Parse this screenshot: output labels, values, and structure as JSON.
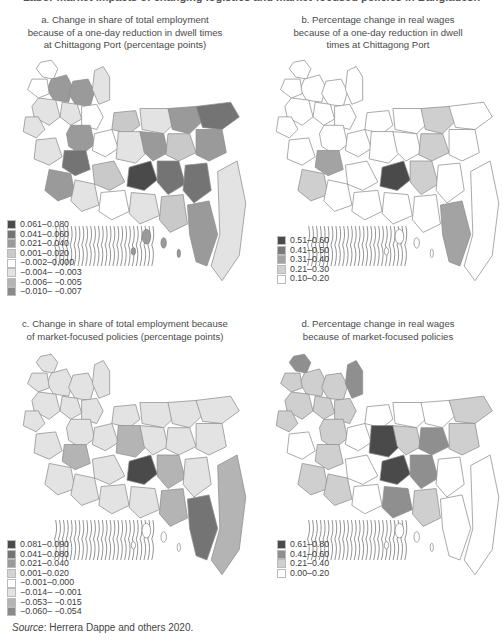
{
  "figure": {
    "title": "Labor market impacts of changing logistics and market-focused policies in Bangladesh"
  },
  "panels": [
    {
      "id": "a",
      "title_lines": [
        "a. Change in share of total employment",
        "because of a one-day reduction in dwell times",
        "at Chittagong Port (percentage points)"
      ],
      "legend": [
        {
          "label": "0.061–0.080",
          "color": "#4a4a4a"
        },
        {
          "label": "0.041–0.060",
          "color": "#747474"
        },
        {
          "label": "0.021–0.040",
          "color": "#9a9a9a"
        },
        {
          "label": "0.001–0.020",
          "color": "#c9c9c9"
        },
        {
          "label": "−0.002–0.000",
          "color": "#ffffff"
        },
        {
          "label": "−0.004– −0.003",
          "color": "#e3e3e3"
        },
        {
          "label": "−0.006– −0.005",
          "color": "#b4b4b4"
        },
        {
          "label": "−0.010– −0.007",
          "color": "#8a8a8a"
        }
      ]
    },
    {
      "id": "b",
      "title_lines": [
        "b. Percentage change in real wages",
        "because of a one-day reduction in dwell",
        "times at Chittagong Port"
      ],
      "legend": [
        {
          "label": "0.51–0.60",
          "color": "#4a4a4a"
        },
        {
          "label": "0.41–0.50",
          "color": "#7a7a7a"
        },
        {
          "label": "0.31–0.40",
          "color": "#a3a3a3"
        },
        {
          "label": "0.21–0.30",
          "color": "#cfcfcf"
        },
        {
          "label": "0.10–0.20",
          "color": "#ffffff"
        }
      ]
    },
    {
      "id": "c",
      "title_lines": [
        "c. Change in share of total employment because",
        "of market-focused policies (percentage points)"
      ],
      "legend": [
        {
          "label": "0.081–0.090",
          "color": "#4a4a4a"
        },
        {
          "label": "0.041–0.080",
          "color": "#747474"
        },
        {
          "label": "0.021–0.040",
          "color": "#9a9a9a"
        },
        {
          "label": "0.001–0.020",
          "color": "#d2d2d2"
        },
        {
          "label": "−0.001–0.000",
          "color": "#ffffff"
        },
        {
          "label": "−0.014– −0.001",
          "color": "#e3e3e3"
        },
        {
          "label": "−0.053– −0.015",
          "color": "#b4b4b4"
        },
        {
          "label": "−0.060– −0.054",
          "color": "#8a8a8a"
        }
      ]
    },
    {
      "id": "d",
      "title_lines": [
        "d. Percentage change in real wages",
        "because of market-focused policies"
      ],
      "legend": [
        {
          "label": "0.61–0.80",
          "color": "#4a4a4a"
        },
        {
          "label": "0.41–0.60",
          "color": "#8f8f8f"
        },
        {
          "label": "0.21–0.40",
          "color": "#cfcfcf"
        },
        {
          "label": "0.00–0.20",
          "color": "#ffffff"
        }
      ]
    }
  ],
  "source": {
    "label": "Source",
    "text": ": Herrera Dappe and others 2020."
  },
  "chart_data": [
    {
      "type": "heatmap",
      "title": "a. Change in share of total employment because of a one-day reduction in dwell times at Chittagong Port (percentage points)",
      "legend_bins": [
        "0.061–0.080",
        "0.041–0.060",
        "0.021–0.040",
        "0.001–0.020",
        "−0.002–0.000",
        "−0.004–−0.003",
        "−0.006–−0.005",
        "−0.010–−0.007"
      ],
      "legend_position": "lower-left",
      "notes": "Choropleth map of Bangladesh districts; darkest districts near Dhaka and Chittagong region."
    },
    {
      "type": "heatmap",
      "title": "b. Percentage change in real wages because of a one-day reduction in dwell times at Chittagong Port",
      "legend_bins": [
        "0.51–0.60",
        "0.41–0.50",
        "0.31–0.40",
        "0.21–0.30",
        "0.10–0.20"
      ],
      "legend_position": "lower-left",
      "notes": "Choropleth map; darkest district near Dhaka, mid-gray around central region and Chittagong coast."
    },
    {
      "type": "heatmap",
      "title": "c. Change in share of total employment because of market-focused policies (percentage points)",
      "legend_bins": [
        "0.081–0.090",
        "0.041–0.080",
        "0.021–0.040",
        "0.001–0.020",
        "−0.001–0.000",
        "−0.014–−0.001",
        "−0.053–−0.015",
        "−0.060–−0.054"
      ],
      "legend_position": "lower-left",
      "notes": "Choropleth map; darkest district at Dhaka, mid-dark in Chittagong hill tracts."
    },
    {
      "type": "heatmap",
      "title": "d. Percentage change in real wages because of market-focused policies",
      "legend_bins": [
        "0.61–0.80",
        "0.41–0.60",
        "0.21–0.40",
        "0.00–0.20"
      ],
      "legend_position": "lower-left",
      "notes": "Choropleth map; darkest districts in central (Tangail) and Dhaka/Narayanganj area; most of west mid-light gray, east mostly white."
    }
  ],
  "maps": {
    "a": [
      "#ffffff",
      "#9a9a9a",
      "#9a9a9a",
      "#e3e3e3",
      "#ffffff",
      "#e3e3e3",
      "#ffffff",
      "#e3e3e3",
      "#9a9a9a",
      "#e3e3e3",
      "#c9c9c9",
      "#e3e3e3",
      "#9a9a9a",
      "#747474",
      "#ffffff",
      "#e3e3e3",
      "#9a9a9a",
      "#c9c9c9",
      "#9a9a9a",
      "#e3e3e3",
      "#747474",
      "#4a4a4a",
      "#747474",
      "#c9c9c9",
      "#747474",
      "#9a9a9a",
      "#e3e3e3",
      "#ffffff",
      "#e3e3e3",
      "#c9c9c9",
      "#9a9a9a",
      "#e3e3e3"
    ],
    "b": [
      "#ffffff",
      "#ffffff",
      "#ffffff",
      "#ffffff",
      "#ffffff",
      "#ffffff",
      "#ffffff",
      "#ffffff",
      "#ffffff",
      "#ffffff",
      "#ffffff",
      "#ffffff",
      "#cfcfcf",
      "#ffffff",
      "#ffffff",
      "#ffffff",
      "#ffffff",
      "#cfcfcf",
      "#ffffff",
      "#ffffff",
      "#a3a3a3",
      "#4a4a4a",
      "#cfcfcf",
      "#ffffff",
      "#ffffff",
      "#cfcfcf",
      "#ffffff",
      "#ffffff",
      "#ffffff",
      "#ffffff",
      "#a3a3a3",
      "#ffffff"
    ],
    "c": [
      "#e3e3e3",
      "#e3e3e3",
      "#e3e3e3",
      "#e3e3e3",
      "#e3e3e3",
      "#e3e3e3",
      "#e3e3e3",
      "#e3e3e3",
      "#e3e3e3",
      "#e3e3e3",
      "#e3e3e3",
      "#e3e3e3",
      "#e3e3e3",
      "#e3e3e3",
      "#e3e3e3",
      "#b4b4b4",
      "#e3e3e3",
      "#e3e3e3",
      "#e3e3e3",
      "#e3e3e3",
      "#b4b4b4",
      "#4a4a4a",
      "#b4b4b4",
      "#e3e3e3",
      "#e3e3e3",
      "#e3e3e3",
      "#e3e3e3",
      "#e3e3e3",
      "#e3e3e3",
      "#b4b4b4",
      "#747474",
      "#b4b4b4"
    ],
    "d": [
      "#8f8f8f",
      "#cfcfcf",
      "#cfcfcf",
      "#8f8f8f",
      "#cfcfcf",
      "#cfcfcf",
      "#cfcfcf",
      "#cfcfcf",
      "#cfcfcf",
      "#cfcfcf",
      "#ffffff",
      "#ffffff",
      "#ffffff",
      "#cfcfcf",
      "#ffffff",
      "#4a4a4a",
      "#cfcfcf",
      "#8f8f8f",
      "#cfcfcf",
      "#ffffff",
      "#cfcfcf",
      "#4a4a4a",
      "#8f8f8f",
      "#ffffff",
      "#ffffff",
      "#cfcfcf",
      "#cfcfcf",
      "#ffffff",
      "#8f8f8f",
      "#cfcfcf",
      "#ffffff",
      "#ffffff"
    ]
  }
}
